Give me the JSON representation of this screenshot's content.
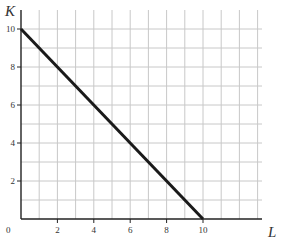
{
  "chart_data": {
    "type": "line",
    "title": "",
    "xlabel": "L",
    "ylabel": "K",
    "xlim": [
      0,
      13
    ],
    "ylim": [
      0,
      10.7
    ],
    "grid": true,
    "x_ticks": [
      "2",
      "4",
      "6",
      "8",
      "10"
    ],
    "y_ticks": [
      "2",
      "4",
      "6",
      "8",
      "10"
    ],
    "origin_label": "0",
    "series": [
      {
        "name": "budget line",
        "x": [
          0,
          10
        ],
        "y": [
          10,
          0
        ],
        "color": "#1a1a1a"
      }
    ]
  }
}
